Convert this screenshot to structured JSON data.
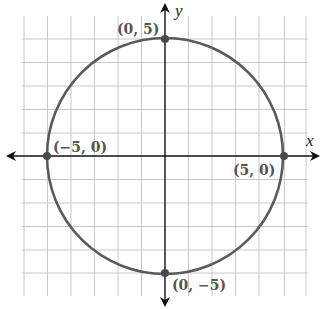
{
  "diagram": {
    "type": "circle-graph",
    "center": [
      0,
      0
    ],
    "radius": 5,
    "equation_hint": "x^2 + y^2 = 25",
    "axes": {
      "x_label": "x",
      "y_label": "y"
    },
    "grid": {
      "min": -6,
      "max": 6,
      "step": 1
    },
    "points": [
      {
        "label": "(0, 5)",
        "x": 0,
        "y": 5
      },
      {
        "label": "(−5, 0)",
        "x": -5,
        "y": 0
      },
      {
        "label": "(5, 0)",
        "x": 5,
        "y": 0
      },
      {
        "label": "(0, −5)",
        "x": 0,
        "y": -5
      }
    ],
    "colors": {
      "curve": "#5a5a5a",
      "grid": "#c8c8c8",
      "axis": "#111111",
      "point": "#4a4a4a"
    }
  }
}
